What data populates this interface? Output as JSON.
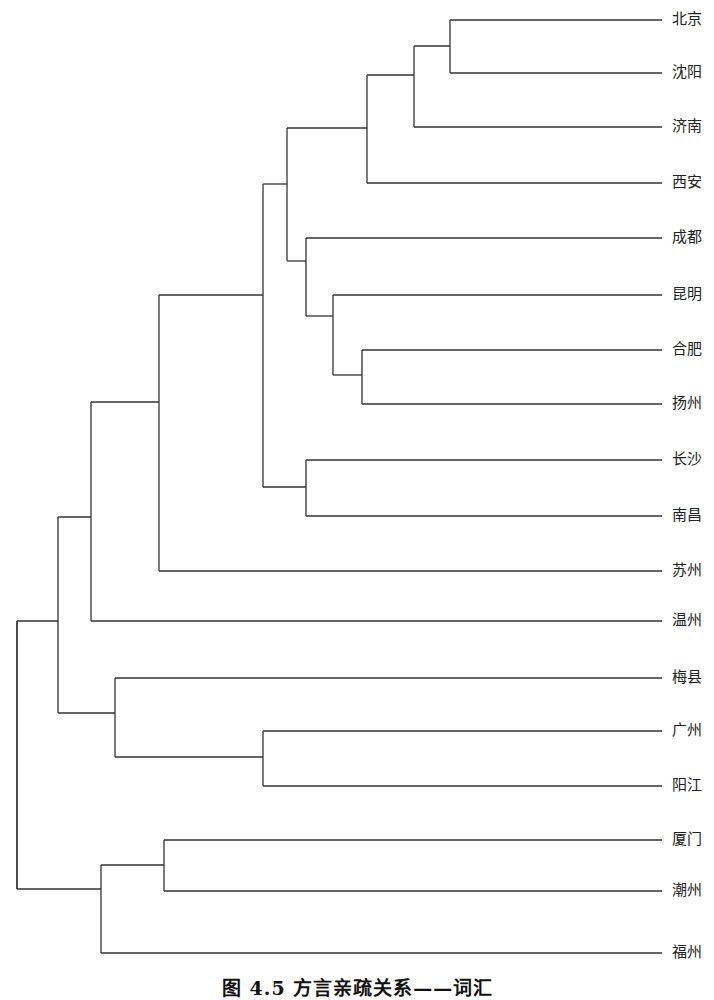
{
  "figure": {
    "caption": "图 4.5 方言亲疏关系——词汇",
    "type": "dendrogram",
    "line_color": "#333333",
    "leaf_line_end_x": 662,
    "label_x": 672
  },
  "chart_data": {
    "type": "dendrogram",
    "title": "图 4.5 方言亲疏关系——词汇",
    "orientation": "horizontal (root left, leaves right)",
    "leaves": [
      "北京",
      "沈阳",
      "济南",
      "西安",
      "成都",
      "昆明",
      "合肥",
      "扬州",
      "长沙",
      "南昌",
      "苏州",
      "温州",
      "梅县",
      "广州",
      "阳江",
      "厦门",
      "潮州",
      "福州"
    ],
    "leaf_y": [
      20,
      73,
      127,
      183,
      238,
      295,
      350,
      404,
      460,
      516,
      571,
      621,
      678,
      731,
      786,
      840,
      891,
      953
    ],
    "nodes": [
      {
        "id": "n1",
        "x": 450,
        "children": [
          "北京",
          "沈阳"
        ],
        "y": [
          20,
          73
        ],
        "join_y": 46
      },
      {
        "id": "n2",
        "x": 414,
        "children": [
          "n1",
          "济南"
        ],
        "y": [
          46,
          127
        ],
        "join_y": 75
      },
      {
        "id": "n3",
        "x": 367,
        "children": [
          "n2",
          "西安"
        ],
        "y": [
          75,
          183
        ],
        "join_y": 128
      },
      {
        "id": "n4",
        "x": 362,
        "children": [
          "合肥",
          "扬州"
        ],
        "y": [
          350,
          404
        ],
        "join_y": 375
      },
      {
        "id": "n5",
        "x": 333,
        "children": [
          "昆明",
          "n4"
        ],
        "y": [
          295,
          375
        ],
        "join_y": 316
      },
      {
        "id": "n6",
        "x": 306,
        "children": [
          "成都",
          "n5"
        ],
        "y": [
          238,
          316
        ],
        "join_y": 261
      },
      {
        "id": "n7",
        "x": 287,
        "children": [
          "n3",
          "n6"
        ],
        "y": [
          128,
          261
        ],
        "join_y": 184
      },
      {
        "id": "n8",
        "x": 306,
        "children": [
          "长沙",
          "南昌"
        ],
        "y": [
          460,
          516
        ],
        "join_y": 487
      },
      {
        "id": "n9",
        "x": 263,
        "children": [
          "n7",
          "n8"
        ],
        "y": [
          184,
          487
        ],
        "join_y": 295
      },
      {
        "id": "n10",
        "x": 159,
        "children": [
          "n9",
          "苏州"
        ],
        "y": [
          295,
          571
        ],
        "join_y": 402
      },
      {
        "id": "n11",
        "x": 91,
        "children": [
          "n10",
          "温州"
        ],
        "y": [
          402,
          621
        ],
        "join_y": 517
      },
      {
        "id": "n12",
        "x": 263,
        "children": [
          "广州",
          "阳江"
        ],
        "y": [
          731,
          786
        ],
        "join_y": 757
      },
      {
        "id": "n13",
        "x": 115,
        "children": [
          "梅县",
          "n12"
        ],
        "y": [
          678,
          757
        ],
        "join_y": 713
      },
      {
        "id": "n14",
        "x": 58,
        "children": [
          "n11",
          "n13"
        ],
        "y": [
          517,
          713
        ],
        "join_y": 621
      },
      {
        "id": "n15",
        "x": 164,
        "children": [
          "厦门",
          "潮州"
        ],
        "y": [
          840,
          891
        ],
        "join_y": 865
      },
      {
        "id": "n16",
        "x": 101,
        "children": [
          "n15",
          "福州"
        ],
        "y": [
          865,
          953
        ],
        "join_y": 889
      },
      {
        "id": "root",
        "x": 17,
        "children": [
          "n14",
          "n16"
        ],
        "y": [
          621,
          889
        ]
      }
    ],
    "clusters_reading": [
      [
        "北京",
        "沈阳",
        "济南",
        "西安",
        "成都",
        "昆明",
        "合肥",
        "扬州",
        "长沙",
        "南昌",
        "苏州",
        "温州",
        "梅县",
        "广州",
        "阳江"
      ],
      [
        "厦门",
        "潮州",
        "福州"
      ]
    ]
  }
}
